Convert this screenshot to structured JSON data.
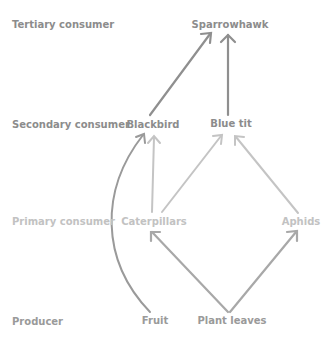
{
  "levels": {
    "tertiary": "Tertiary consumer",
    "secondary": "Secondary consumer",
    "primary": "Primary consumer",
    "producer": "Producer"
  },
  "organisms": {
    "sparrowhawk": "Sparrowhawk",
    "blackbird": "Blackbird",
    "blue_tit": "Blue tit",
    "caterpillars": "Caterpillars",
    "aphids": "Aphids",
    "fruit": "Fruit",
    "plant_leaves": "Plant leaves"
  },
  "links": [
    {
      "from": "Blackbird",
      "to": "Sparrowhawk"
    },
    {
      "from": "Blue tit",
      "to": "Sparrowhawk"
    },
    {
      "from": "Fruit",
      "to": "Blackbird"
    },
    {
      "from": "Caterpillars",
      "to": "Blackbird"
    },
    {
      "from": "Caterpillars",
      "to": "Blue tit"
    },
    {
      "from": "Aphids",
      "to": "Blue tit"
    },
    {
      "from": "Plant leaves",
      "to": "Caterpillars"
    },
    {
      "from": "Plant leaves",
      "to": "Aphids"
    }
  ],
  "colors": {
    "tertiary_arrows": "#8f8f8f",
    "secondary_arrows": "#c4c4c4",
    "primary_arrows": "#a8a8a8",
    "fruit_arrow": "#9a9a9a"
  }
}
